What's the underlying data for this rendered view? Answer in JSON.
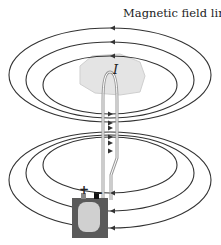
{
  "diagram": {
    "title": "Magnetic field lines",
    "current_label": "I",
    "battery": {
      "positive": "+",
      "negative": "−"
    },
    "colors": {
      "line": "#333333",
      "hand": "#e2e2e2",
      "battery_body": "#5a5a5a",
      "battery_inner": "#cfcfcf",
      "wire": "#888888"
    }
  }
}
